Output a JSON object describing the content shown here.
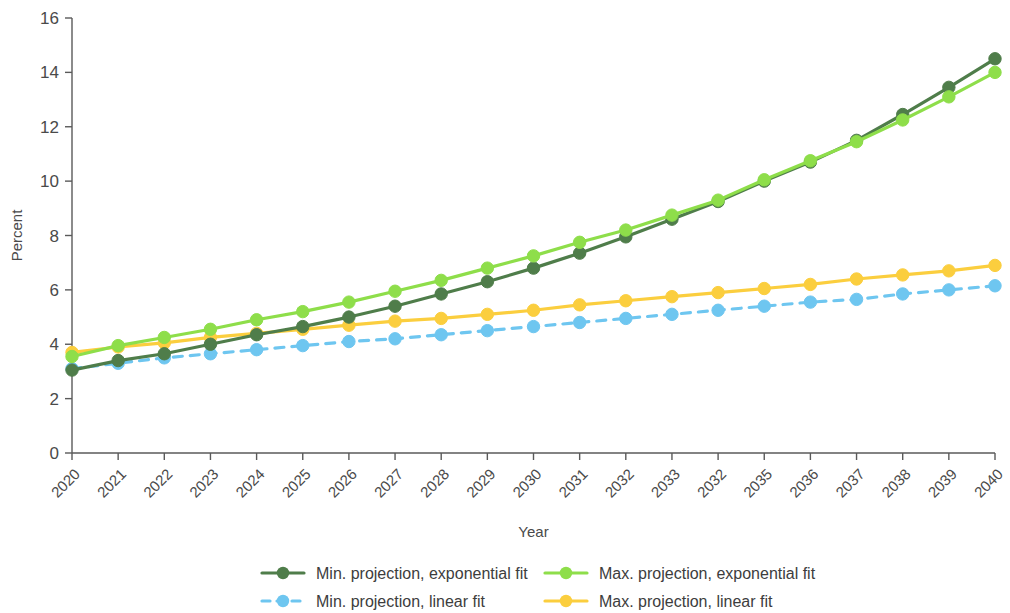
{
  "chart_data": {
    "type": "line",
    "title": "",
    "xlabel": "Year",
    "ylabel": "Percent",
    "ylim": [
      0,
      16
    ],
    "yticks": [
      0,
      2,
      4,
      6,
      8,
      10,
      12,
      14,
      16
    ],
    "grid": false,
    "legend_position": "bottom",
    "categories": [
      "2020",
      "2021",
      "2022",
      "2023",
      "2024",
      "2025",
      "2026",
      "2027",
      "2028",
      "2029",
      "2030",
      "2031",
      "2032",
      "2033",
      "2032",
      "2035",
      "2036",
      "2037",
      "2038",
      "2039",
      "2040"
    ],
    "series": [
      {
        "name": "Min. projection, exponential fit",
        "color": "#4f7d4a",
        "line_style": "solid",
        "marker": "circle",
        "values": [
          3.05,
          3.4,
          3.65,
          4.0,
          4.35,
          4.65,
          5.0,
          5.4,
          5.85,
          6.3,
          6.8,
          7.35,
          7.95,
          8.6,
          9.25,
          10.0,
          10.7,
          11.5,
          12.45,
          13.45,
          14.5
        ]
      },
      {
        "name": "Max. projection, exponential fit",
        "color": "#8ede4a",
        "line_style": "solid",
        "marker": "circle",
        "values": [
          3.55,
          3.95,
          4.25,
          4.55,
          4.9,
          5.2,
          5.55,
          5.95,
          6.35,
          6.8,
          7.25,
          7.75,
          8.2,
          8.75,
          9.3,
          10.05,
          10.75,
          11.45,
          12.25,
          13.1,
          14.0
        ]
      },
      {
        "name": "Min. projection, linear fit",
        "color": "#6ec6f0",
        "line_style": "dashed",
        "marker": "circle",
        "values": [
          3.1,
          3.3,
          3.5,
          3.65,
          3.8,
          3.95,
          4.1,
          4.2,
          4.35,
          4.5,
          4.65,
          4.8,
          4.95,
          5.1,
          5.25,
          5.4,
          5.55,
          5.65,
          5.85,
          6.0,
          6.15
        ]
      },
      {
        "name": "Max. projection, linear fit",
        "color": "#fbce3e",
        "line_style": "solid",
        "marker": "circle",
        "values": [
          3.7,
          3.9,
          4.05,
          4.25,
          4.4,
          4.55,
          4.7,
          4.85,
          4.95,
          5.1,
          5.25,
          5.45,
          5.6,
          5.75,
          5.9,
          6.05,
          6.2,
          6.4,
          6.55,
          6.7,
          6.9
        ]
      }
    ]
  },
  "legend": {
    "entries": [
      {
        "label": "Min. projection, exponential fit"
      },
      {
        "label": "Max. projection, exponential fit"
      },
      {
        "label": "Min. projection, linear fit"
      },
      {
        "label": "Max. projection, linear fit"
      }
    ]
  }
}
